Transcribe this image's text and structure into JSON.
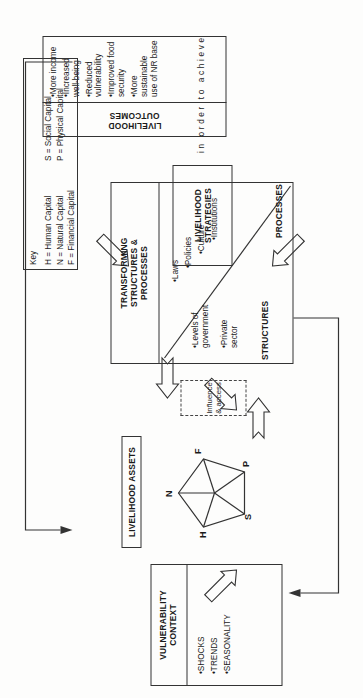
{
  "diagram": {
    "orientation": "rotated-90-ccw"
  },
  "key_box": {
    "title": "Key",
    "entries": [
      "H = Human Capital",
      "N = Natural Capital",
      "F = Financial Capital",
      "S = Social Capital",
      "P = Physical Capital"
    ],
    "col1": [
      "H = Human Capital",
      "N = Natural Capital",
      "F = Financial Capital"
    ],
    "col2": [
      "S = Social Capital",
      "P = Physical Capital"
    ]
  },
  "vulnerability_context": {
    "title": "VULNERABILITY\nCONTEXT",
    "items": [
      "SHOCKS",
      "TRENDS",
      "SEASONALITY"
    ]
  },
  "livelihood_assets": {
    "label": "LIVELIHOOD ASSETS",
    "pentagon_nodes": [
      "H",
      "N",
      "F",
      "P",
      "S"
    ]
  },
  "influence": {
    "label": "Influence\n& access"
  },
  "transforming": {
    "title": "TRANSFORMING\nSTRUCTURES &\nPROCESSES",
    "structures_label": "STRUCTURES",
    "processes_label": "PROCESSES",
    "structures_items": [
      "Levels of\ngovernment",
      "Private\nsector"
    ],
    "processes_items": [
      "Laws",
      "Policies",
      "Culture",
      "Institutions"
    ]
  },
  "livelihood_strategies": {
    "label": "LIVELIHOOD\nSTRATEGIES"
  },
  "connector": {
    "text": "in order to achieve"
  },
  "livelihood_outcomes": {
    "title": "LIVELIHOOD\nOUTCOMES",
    "items": [
      "More income",
      "Increased\nwell-being",
      "Reduced\nvulnerability",
      "Improved food\nsecurity",
      "More sustainable\nuse of NR base"
    ]
  },
  "colors": {
    "stroke": "#333333",
    "background": "#fdfdfc",
    "text": "#1a1a1a"
  }
}
